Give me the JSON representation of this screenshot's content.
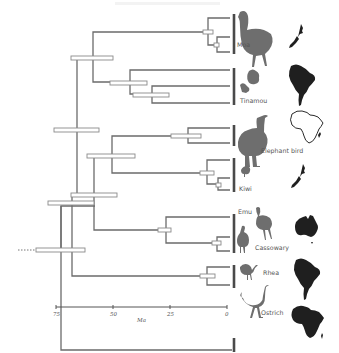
{
  "diagram": {
    "type": "time-calibrated phylogeny",
    "axis": {
      "label": "Ma",
      "ticks": [
        {
          "value": "75",
          "x": 56
        },
        {
          "value": "50",
          "x": 113
        },
        {
          "value": "25",
          "x": 170
        },
        {
          "value": "0",
          "x": 227
        }
      ]
    },
    "taxa": [
      {
        "name": "Moa",
        "region": "New Zealand"
      },
      {
        "name": "Tinamou",
        "region": "South America"
      },
      {
        "name": "Elephant bird",
        "region": "Madagascar"
      },
      {
        "name": "Kiwi",
        "region": "New Zealand"
      },
      {
        "name": "Emu",
        "region": "Australia"
      },
      {
        "name": "Cassowary",
        "region": "Australia"
      },
      {
        "name": "Rhea",
        "region": "South America"
      },
      {
        "name": "Ostrich",
        "region": "Africa"
      }
    ],
    "colors": {
      "branch": "#6b6b6b",
      "silhouette": "#6e6e6e",
      "map": "#1f1f1f"
    }
  }
}
